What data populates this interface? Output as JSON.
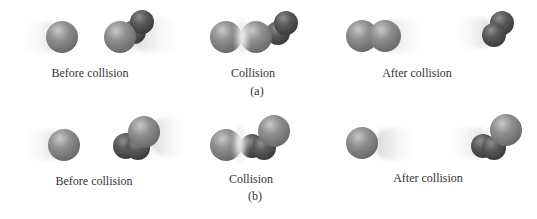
{
  "figure": {
    "colors": {
      "light_sphere": "#8a8a8a",
      "light_sphere_highlight": "#c4c4c4",
      "dark_sphere": "#555555",
      "dark_sphere_highlight": "#8c8c8c",
      "motion_blur": "#d0d0d0",
      "text": "#333333"
    },
    "rows": [
      {
        "panel_label": "(a)",
        "stages": [
          {
            "label": "Before collision"
          },
          {
            "label": "Collision"
          },
          {
            "label": "After collision"
          }
        ]
      },
      {
        "panel_label": "(b)",
        "stages": [
          {
            "label": "Before collision"
          },
          {
            "label": "Collision"
          },
          {
            "label": "After collision"
          }
        ]
      }
    ]
  }
}
